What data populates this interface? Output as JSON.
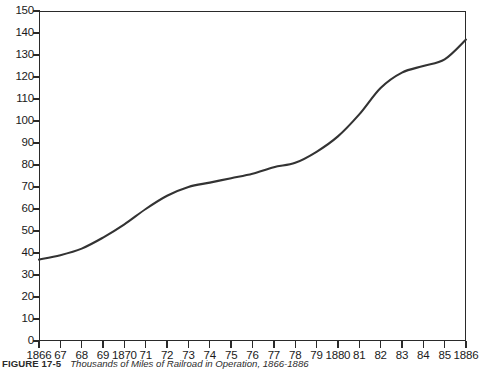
{
  "chart_data": {
    "type": "line",
    "title": "Thousands of Miles of Railroad in Operation, 1866-1886",
    "figure_label": "FIGURE 17-5",
    "xlabel": "",
    "ylabel": "",
    "xlim": [
      1866,
      1886
    ],
    "ylim": [
      0,
      150
    ],
    "grid": false,
    "legend": null,
    "y_ticks": [
      0,
      10,
      20,
      30,
      40,
      50,
      60,
      70,
      80,
      90,
      100,
      110,
      120,
      130,
      140,
      150
    ],
    "y_tick_labels": [
      "0",
      "10",
      "20",
      "30",
      "40",
      "50",
      "60",
      "70",
      "80",
      "90",
      "100",
      "110",
      "120",
      "130",
      "140",
      "150"
    ],
    "x_ticks": [
      1866,
      1867,
      1868,
      1869,
      1870,
      1871,
      1872,
      1873,
      1874,
      1875,
      1876,
      1877,
      1878,
      1879,
      1880,
      1881,
      1882,
      1883,
      1884,
      1885,
      1886
    ],
    "x_tick_labels": [
      "1866",
      "67",
      "68",
      "69",
      "1870",
      "71",
      "72",
      "73",
      "74",
      "75",
      "76",
      "77",
      "78",
      "79",
      "1880",
      "81",
      "82",
      "83",
      "84",
      "85",
      "1886"
    ],
    "x": [
      1866,
      1867,
      1868,
      1869,
      1870,
      1871,
      1872,
      1873,
      1874,
      1875,
      1876,
      1877,
      1878,
      1879,
      1880,
      1881,
      1882,
      1883,
      1884,
      1885,
      1886
    ],
    "values": [
      37,
      39,
      42,
      47,
      53,
      60,
      66,
      70,
      72,
      74,
      76,
      79,
      81,
      86,
      93,
      103,
      115,
      122,
      125,
      128,
      137
    ],
    "series": [
      {
        "name": "Miles of railroad in operation (thousands)",
        "values": [
          37,
          39,
          42,
          47,
          53,
          60,
          66,
          70,
          72,
          74,
          76,
          79,
          81,
          86,
          93,
          103,
          115,
          122,
          125,
          128,
          137
        ],
        "color": "#333333"
      }
    ]
  },
  "caption": {
    "label": "FIGURE 17-5",
    "title": "Thousands of Miles of Railroad in Operation, 1866-1886"
  }
}
